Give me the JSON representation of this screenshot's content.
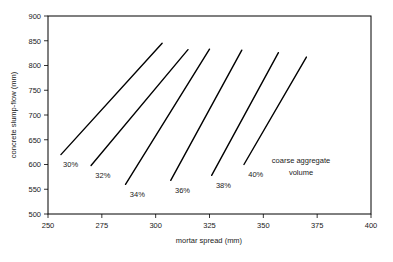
{
  "chart_data": {
    "type": "line",
    "title": "",
    "xlabel": "mortar spread (mm)",
    "ylabel": "concrete slump-flow (mm)",
    "xlim": [
      250,
      400
    ],
    "ylim": [
      500,
      900
    ],
    "xticks": [
      250,
      275,
      300,
      325,
      350,
      375,
      400
    ],
    "xtick_labels": [
      "250",
      "275",
      "300",
      "325",
      "350",
      "375",
      "400"
    ],
    "yticks": [
      500,
      550,
      600,
      650,
      700,
      750,
      800,
      850,
      900
    ],
    "ytick_labels": [
      "500",
      "550",
      "600",
      "650",
      "700",
      "750",
      "800",
      "850",
      "900"
    ],
    "grid": false,
    "legend_position": "inline-annotations",
    "annotation": {
      "line1": "coarse aggregate",
      "line2": "volume"
    },
    "series": [
      {
        "name": "30%",
        "label": "30%",
        "x": [
          256,
          303
        ],
        "y": [
          620,
          845
        ],
        "label_x": 257,
        "label_y": 600
      },
      {
        "name": "32%",
        "label": "32%",
        "x": [
          270,
          315
        ],
        "y": [
          598,
          832
        ],
        "label_x": 272,
        "label_y": 578
      },
      {
        "name": "34%",
        "label": "34%",
        "x": [
          286,
          325
        ],
        "y": [
          560,
          833
        ],
        "label_x": 288,
        "label_y": 540
      },
      {
        "name": "36%",
        "label": "36%",
        "x": [
          307,
          340
        ],
        "y": [
          568,
          831
        ],
        "label_x": 309,
        "label_y": 548
      },
      {
        "name": "38%",
        "label": "38%",
        "x": [
          326,
          357
        ],
        "y": [
          578,
          826
        ],
        "label_x": 328,
        "label_y": 558
      },
      {
        "name": "40%",
        "label": "40%",
        "x": [
          341,
          370
        ],
        "y": [
          600,
          817
        ],
        "label_x": 343,
        "label_y": 580
      }
    ]
  },
  "colors": {
    "axis": "#000000",
    "line": "#000000",
    "text": "#1a1a1a",
    "background": "#ffffff"
  }
}
